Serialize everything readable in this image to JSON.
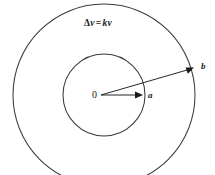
{
  "figure": {
    "kind": "concentric-circles-diagram",
    "background_color": "#ffffff",
    "stroke_color": "#3a3a3a",
    "text_color": "#1a1a1a",
    "width": 215,
    "height": 175
  },
  "formula": {
    "full_text": "Δv = kv",
    "delta": "Δ",
    "lhs_var": "v",
    "operator": "=",
    "coefficient": "k",
    "rhs_var": "v"
  },
  "labels": {
    "center": "0",
    "inner_radius": "a",
    "outer_radius": "b"
  },
  "geometry": {
    "center_x": 104,
    "center_y": 95,
    "inner_radius": 41,
    "outer_radius": 91,
    "inner_arrow_tip_x": 143,
    "inner_arrow_tip_y": 95,
    "outer_arrow_tip_x": 194,
    "outer_arrow_tip_y": 67
  }
}
